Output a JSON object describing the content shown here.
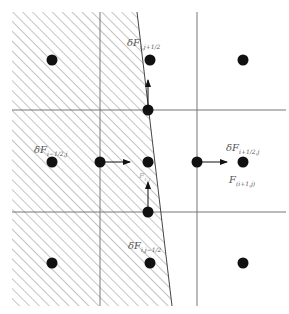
{
  "figure": {
    "colors": {
      "grid": "#777777",
      "hatch": "#8a8a8a",
      "node": "#111111",
      "label": "#555555",
      "background": "#ffffff"
    }
  },
  "grid": {
    "vertical_lines_x": [
      100,
      197
    ],
    "horizontal_lines_y": [
      110,
      212
    ],
    "extent": {
      "x0": 12,
      "x1": 286,
      "y0": 12,
      "y1": 306
    }
  },
  "boundary": {
    "top": [
      137,
      12
    ],
    "bottom": [
      172,
      306
    ]
  },
  "nodes": [
    {
      "x": 52,
      "y": 60
    },
    {
      "x": 150,
      "y": 60
    },
    {
      "x": 243,
      "y": 60
    },
    {
      "x": 148,
      "y": 110
    },
    {
      "x": 52,
      "y": 162
    },
    {
      "x": 100,
      "y": 162
    },
    {
      "x": 148,
      "y": 162
    },
    {
      "x": 197,
      "y": 162
    },
    {
      "x": 243,
      "y": 162
    },
    {
      "x": 148,
      "y": 212
    },
    {
      "x": 52,
      "y": 263
    },
    {
      "x": 150,
      "y": 263
    },
    {
      "x": 243,
      "y": 263
    }
  ],
  "arrows": [
    {
      "from": [
        100,
        162
      ],
      "to": [
        130,
        162
      ]
    },
    {
      "from": [
        197,
        162
      ],
      "to": [
        227,
        162
      ]
    },
    {
      "from": [
        148,
        110
      ],
      "to": [
        148,
        80
      ]
    },
    {
      "from": [
        148,
        212
      ],
      "to": [
        148,
        182
      ]
    }
  ],
  "labels": {
    "flux_top": {
      "main": "δF",
      "sub": "i,j+1/2"
    },
    "flux_left": {
      "main": "δF",
      "sub": "i−1/2,j"
    },
    "flux_right": {
      "main": "δF",
      "sub": "i+1/2,j"
    },
    "flux_center": {
      "main": "F",
      "sub": "i,j"
    },
    "flux_right_cell": {
      "main": "F",
      "sub": "(i+1,j)"
    },
    "flux_bottom": {
      "main": "δF",
      "sub": "i,j−1/2"
    }
  }
}
